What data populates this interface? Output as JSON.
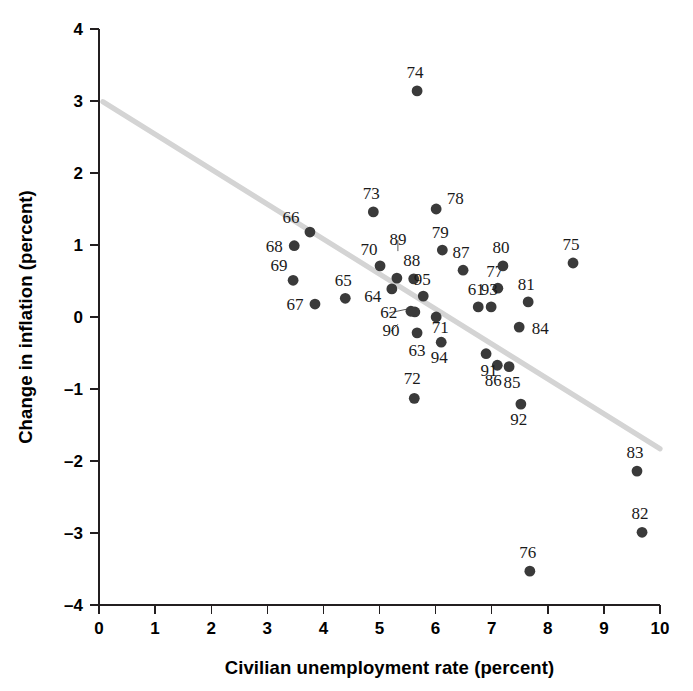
{
  "chart_data": {
    "type": "scatter",
    "title": "",
    "xlabel": "Civilian unemployment rate (percent)",
    "ylabel": "Change in inflation (percent)",
    "xlim": [
      0,
      10
    ],
    "ylim": [
      -4,
      4
    ],
    "xticks": [
      "0",
      "1",
      "2",
      "3",
      "4",
      "5",
      "6",
      "7",
      "8",
      "9",
      "10"
    ],
    "yticks": [
      "4",
      "3",
      "2",
      "1",
      "0",
      "-1",
      "-2",
      "-3",
      "-4"
    ],
    "grid": false,
    "legend": null,
    "point_label_field": "year",
    "points": [
      {
        "year": "61",
        "x": 6.76,
        "y": 0.14
      },
      {
        "year": "62",
        "x": 5.63,
        "y": 0.07
      },
      {
        "year": "63",
        "x": 5.67,
        "y": -0.22
      },
      {
        "year": "64",
        "x": 5.22,
        "y": 0.39
      },
      {
        "year": "65",
        "x": 4.39,
        "y": 0.26
      },
      {
        "year": "66",
        "x": 3.76,
        "y": 1.18
      },
      {
        "year": "67",
        "x": 3.85,
        "y": 0.18
      },
      {
        "year": "68",
        "x": 3.48,
        "y": 0.99
      },
      {
        "year": "69",
        "x": 3.46,
        "y": 0.51
      },
      {
        "year": "70",
        "x": 5.01,
        "y": 0.71
      },
      {
        "year": "71",
        "x": 6.01,
        "y": 0.0
      },
      {
        "year": "72",
        "x": 5.62,
        "y": -1.13
      },
      {
        "year": "73",
        "x": 4.89,
        "y": 1.46
      },
      {
        "year": "74",
        "x": 5.67,
        "y": 3.14
      },
      {
        "year": "75",
        "x": 8.45,
        "y": 0.75
      },
      {
        "year": "76",
        "x": 7.68,
        "y": -3.53
      },
      {
        "year": "77",
        "x": 7.11,
        "y": 0.4
      },
      {
        "year": "78",
        "x": 6.01,
        "y": 1.5
      },
      {
        "year": "79",
        "x": 6.12,
        "y": 0.93
      },
      {
        "year": "80",
        "x": 7.2,
        "y": 0.71
      },
      {
        "year": "81",
        "x": 7.65,
        "y": 0.21
      },
      {
        "year": "82",
        "x": 9.68,
        "y": -2.99
      },
      {
        "year": "83",
        "x": 9.59,
        "y": -2.14
      },
      {
        "year": "84",
        "x": 7.49,
        "y": -0.14
      },
      {
        "year": "85",
        "x": 7.31,
        "y": -0.69
      },
      {
        "year": "86",
        "x": 7.1,
        "y": -0.67
      },
      {
        "year": "87",
        "x": 6.49,
        "y": 0.65
      },
      {
        "year": "88",
        "x": 5.61,
        "y": 0.53
      },
      {
        "year": "89",
        "x": 5.31,
        "y": 0.54
      },
      {
        "year": "90",
        "x": 5.56,
        "y": 0.08
      },
      {
        "year": "91",
        "x": 6.9,
        "y": -0.51
      },
      {
        "year": "92",
        "x": 7.52,
        "y": -1.21
      },
      {
        "year": "93",
        "x": 6.99,
        "y": 0.14
      },
      {
        "year": "94",
        "x": 6.1,
        "y": -0.35
      },
      {
        "year": "95",
        "x": 5.78,
        "y": 0.29
      }
    ],
    "trend_line": {
      "x1": 0.07,
      "y1": 2.99,
      "x2": 10.0,
      "y2": -1.83,
      "color": "#d4d4d4"
    }
  },
  "label_offsets": {
    "61": {
      "dx": -2,
      "dy": -12,
      "anchor": "middle"
    },
    "62": {
      "dx": -26,
      "dy": 6,
      "anchor": "middle",
      "leader": {
        "x2": -7,
        "y2": -3
      }
    },
    "63": {
      "dx": 0,
      "dy": 23,
      "anchor": "middle"
    },
    "64": {
      "dx": -19,
      "dy": 13,
      "anchor": "middle"
    },
    "65": {
      "dx": -2,
      "dy": -12,
      "anchor": "middle"
    },
    "66": {
      "dx": -19,
      "dy": -9,
      "anchor": "middle"
    },
    "67": {
      "dx": -20,
      "dy": 6,
      "anchor": "middle"
    },
    "68": {
      "dx": -20,
      "dy": 6,
      "anchor": "middle"
    },
    "69": {
      "dx": -14,
      "dy": -9,
      "anchor": "middle"
    },
    "70": {
      "dx": -11,
      "dy": -11,
      "anchor": "middle"
    },
    "71": {
      "dx": 4,
      "dy": 16,
      "anchor": "middle"
    },
    "72": {
      "dx": -2,
      "dy": -14,
      "anchor": "middle"
    },
    "73": {
      "dx": -2,
      "dy": -13,
      "anchor": "middle"
    },
    "74": {
      "dx": -2,
      "dy": -13,
      "anchor": "middle"
    },
    "75": {
      "dx": -2,
      "dy": -13,
      "anchor": "middle"
    },
    "76": {
      "dx": -2,
      "dy": -13,
      "anchor": "middle"
    },
    "77": {
      "dx": -3,
      "dy": -11,
      "anchor": "middle"
    },
    "78": {
      "dx": 19,
      "dy": -5,
      "anchor": "middle"
    },
    "79": {
      "dx": -2,
      "dy": -12,
      "anchor": "middle"
    },
    "80": {
      "dx": -2,
      "dy": -13,
      "anchor": "middle"
    },
    "81": {
      "dx": -2,
      "dy": -12,
      "anchor": "middle"
    },
    "82": {
      "dx": -2,
      "dy": -13,
      "anchor": "middle"
    },
    "83": {
      "dx": -2,
      "dy": -13,
      "anchor": "middle"
    },
    "84": {
      "dx": 21,
      "dy": 7,
      "anchor": "middle"
    },
    "85": {
      "dx": 3,
      "dy": 21,
      "anchor": "middle"
    },
    "86": {
      "dx": -4,
      "dy": 21,
      "anchor": "middle"
    },
    "87": {
      "dx": -2,
      "dy": -12,
      "anchor": "middle"
    },
    "88": {
      "dx": -2,
      "dy": -13,
      "anchor": "middle"
    },
    "89": {
      "dx": 1,
      "dy": -33,
      "anchor": "middle",
      "leader": {
        "x2": 1,
        "y2": -27
      }
    },
    "90": {
      "dx": -20,
      "dy": 25,
      "anchor": "middle",
      "leader": {
        "x2": -13,
        "y2": 13
      }
    },
    "91": {
      "dx": 3,
      "dy": 22,
      "anchor": "middle"
    },
    "92": {
      "dx": -2,
      "dy": 21,
      "anchor": "middle"
    },
    "93": {
      "dx": -2,
      "dy": -12,
      "anchor": "middle"
    },
    "94": {
      "dx": -2,
      "dy": 21,
      "anchor": "middle"
    },
    "95": {
      "dx": -1,
      "dy": -11,
      "anchor": "middle"
    }
  },
  "geometry": {
    "origin_x_px": 99,
    "origin_y_px": 605,
    "px_per_x_unit": 56.1,
    "px_per_y_unit": 72,
    "dot_radius": 5.4
  }
}
